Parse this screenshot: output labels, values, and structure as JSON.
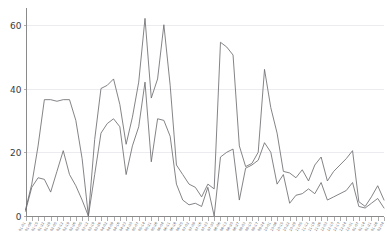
{
  "chart_data": {
    "type": "line",
    "title": "",
    "subtitle": "",
    "xlabel": "",
    "ylabel": "",
    "ylim": [
      0,
      64
    ],
    "yticks": [
      0,
      20,
      40,
      60
    ],
    "ytick_labels": [
      "0",
      "20",
      "40",
      "60"
    ],
    "grid": true,
    "grid_axis": "y",
    "legend": false,
    "legend_position": "none",
    "xtick_rotation": -60,
    "categories": [
      "01-01",
      "01-08",
      "01-15",
      "01-22",
      "01-29",
      "02-05",
      "02-12",
      "02-19",
      "02-26",
      "03-05",
      "03-12",
      "03-19",
      "03-26",
      "04-02",
      "04-09",
      "04-16",
      "04-23",
      "04-30",
      "05-07",
      "05-14",
      "05-21",
      "05-28",
      "06-04",
      "06-11",
      "06-18",
      "06-25",
      "07-02",
      "07-09",
      "07-16",
      "07-23",
      "07-30",
      "08-06",
      "08-13",
      "08-20",
      "08-27",
      "09-03",
      "09-10",
      "09-17",
      "09-24",
      "10-01",
      "10-08",
      "10-15",
      "10-22",
      "10-29",
      "11-05",
      "11-12",
      "11-19",
      "11-26",
      "12-03",
      "12-10",
      "12-17",
      "12-24",
      "12-31",
      "01-07",
      "01-14",
      "01-21",
      "01-28",
      "02-04"
    ],
    "series": [
      {
        "name": "series-1",
        "color": "#6e6e72",
        "values": [
          2,
          10,
          22,
          36.5,
          36.5,
          36,
          36.5,
          36.5,
          30,
          18,
          0,
          24,
          40,
          41,
          43,
          35,
          22.5,
          31,
          42,
          62,
          37,
          43,
          60,
          41,
          16,
          13,
          10,
          9,
          6,
          10,
          8.5,
          54.5,
          53,
          50.5,
          22,
          15.5,
          16.5,
          20,
          46,
          34,
          26,
          14,
          13.5,
          12,
          14.5,
          11,
          16,
          18.5,
          11,
          14,
          16,
          18,
          20.5,
          4.5,
          3,
          6,
          9.5,
          5
        ]
      },
      {
        "name": "series-2",
        "color": "#6e6e72",
        "values": [
          1.5,
          9,
          12,
          11.5,
          7.5,
          14,
          20.5,
          13,
          9.5,
          5,
          0,
          13,
          26,
          29,
          30.5,
          28,
          13,
          22,
          28,
          42,
          17,
          30.5,
          30,
          25,
          10,
          5,
          3.5,
          4,
          3,
          9,
          0,
          18.5,
          20,
          21,
          5,
          15,
          16,
          17.5,
          23,
          20,
          10,
          13,
          4,
          6.5,
          7,
          8.5,
          7,
          10.5,
          5,
          6,
          7,
          8,
          10.5,
          3,
          2.5,
          4,
          5.5,
          2.5
        ]
      }
    ]
  }
}
